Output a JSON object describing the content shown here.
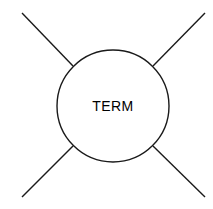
{
  "diagram": {
    "title": "TERM",
    "background_color": "#ffffff",
    "stroke_color": "#1a1a1a",
    "label_color": "#000000",
    "node": {
      "label": "TERM",
      "shape": "circle",
      "center_x": 113,
      "center_y": 106,
      "radius": 56,
      "fill": "#ffffff"
    },
    "connectors": [
      {
        "name": "top-left",
        "label": "",
        "x1": 22,
        "y1": 13,
        "x2": 73,
        "y2": 66
      },
      {
        "name": "top-right",
        "label": "",
        "x1": 205,
        "y1": 13,
        "x2": 153,
        "y2": 66
      },
      {
        "name": "bottom-left",
        "label": "",
        "x1": 22,
        "y1": 197,
        "x2": 73,
        "y2": 146
      },
      {
        "name": "bottom-right",
        "label": "",
        "x1": 205,
        "y1": 197,
        "x2": 153,
        "y2": 146
      }
    ]
  }
}
